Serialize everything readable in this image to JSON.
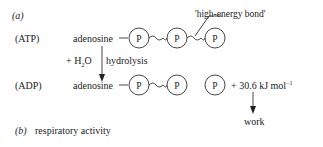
{
  "part_a": {
    "label": "(a)",
    "atp_row": {
      "label": "(ATP)",
      "molecule": "adenosine",
      "phosphates": [
        "P",
        "P",
        "P"
      ],
      "annotation": "'high-energy  bond'"
    },
    "reaction": {
      "reagent": "+ H",
      "reagent_sub": "2",
      "reagent_tail": "O",
      "process": "hydrolysis"
    },
    "adp_row": {
      "label": "(ADP)",
      "molecule": "adenosine",
      "phosphates": [
        "P",
        "P"
      ],
      "free_phosphate": "P",
      "energy": "+ 30.6 kJ mol",
      "energy_sup": "−1",
      "output": "work"
    }
  },
  "part_b": {
    "label": "(b)",
    "title": "respiratory activity"
  },
  "colors": {
    "ink": "#222222",
    "line": "#333333",
    "background": "#ffffff"
  }
}
